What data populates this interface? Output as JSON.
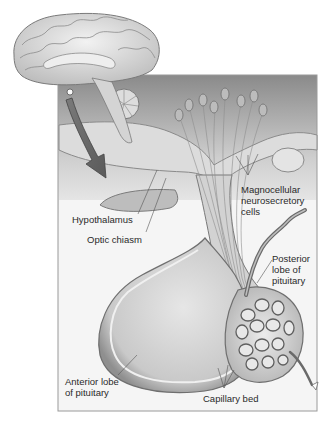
{
  "figure": {
    "colors": {
      "background": "#ffffff",
      "panel": "#f4f4f4",
      "frame": "#9a9a9a",
      "tissue_dark": "#6f6f6f",
      "tissue_mid": "#a8a8a8",
      "tissue_light": "#d9d9d9",
      "leader_line": "#555555",
      "text": "#2a2a2a"
    }
  },
  "labels": {
    "hypothalamus": {
      "lines": [
        "Hypothalamus"
      ]
    },
    "optic_chiasm": {
      "lines": [
        "Optic chiasm"
      ]
    },
    "magnocellular": {
      "lines": [
        "Magnocellular",
        "neurosecretory",
        "cells"
      ]
    },
    "posterior_lobe": {
      "lines": [
        "Posterior",
        "lobe of",
        "pituitary"
      ]
    },
    "anterior_lobe": {
      "lines": [
        "Anterior lobe",
        "of pituitary"
      ]
    },
    "capillary_bed": {
      "lines": [
        "Capillary bed"
      ]
    }
  }
}
